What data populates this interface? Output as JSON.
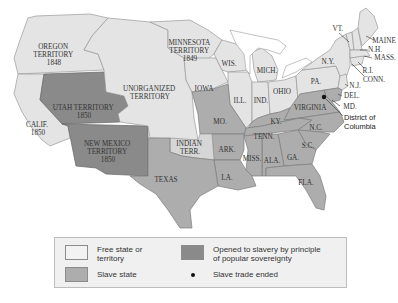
{
  "map": {
    "territories": {
      "oregon": {
        "name": "OREGON",
        "kind": "TERRITORY",
        "year": "1848",
        "status": "free"
      },
      "minnesota": {
        "name": "MINNESOTA",
        "kind": "TERRITORY",
        "year": "1849",
        "status": "free"
      },
      "unorganized": {
        "name": "UNORGANIZED",
        "kind": "TERRITORY",
        "status": "free"
      },
      "utah": {
        "name": "UTAH TERRITORY",
        "year": "1850",
        "status": "popular-sovereignty"
      },
      "new_mexico": {
        "name": "NEW MEXICO",
        "kind": "TERRITORY",
        "year": "1850",
        "status": "popular-sovereignty"
      },
      "indian": {
        "name": "INDIAN",
        "kind": "TERR.",
        "status": "indian-territory"
      }
    },
    "states": {
      "calif": {
        "name": "CALIF.",
        "year": "1850",
        "status": "free"
      },
      "iowa": {
        "name": "IOWA",
        "status": "free"
      },
      "wis": {
        "name": "WIS.",
        "status": "free"
      },
      "mich": {
        "name": "MICH.",
        "status": "free"
      },
      "ill": {
        "name": "ILL.",
        "status": "free"
      },
      "ind": {
        "name": "IND.",
        "status": "free"
      },
      "ohio": {
        "name": "OHIO",
        "status": "free"
      },
      "pa": {
        "name": "PA.",
        "status": "free"
      },
      "ny": {
        "name": "N.Y.",
        "status": "free"
      },
      "vt": {
        "name": "VT.",
        "status": "free"
      },
      "maine": {
        "name": "MAINE",
        "status": "free"
      },
      "nh": {
        "name": "N.H.",
        "status": "free"
      },
      "mass": {
        "name": "MASS.",
        "status": "free"
      },
      "ri": {
        "name": "R.I.",
        "status": "free"
      },
      "conn": {
        "name": "CONN.",
        "status": "free"
      },
      "nj": {
        "name": "N.J.",
        "status": "free"
      },
      "del": {
        "name": "DEL.",
        "status": "slave"
      },
      "md": {
        "name": "MD.",
        "status": "slave"
      },
      "mo": {
        "name": "MO.",
        "status": "slave"
      },
      "ky": {
        "name": "KY.",
        "status": "slave"
      },
      "virginia": {
        "name": "VIRGINIA",
        "status": "slave"
      },
      "tenn": {
        "name": "TENN.",
        "status": "slave"
      },
      "nc": {
        "name": "N.C.",
        "status": "slave"
      },
      "sc": {
        "name": "S.C.",
        "status": "slave"
      },
      "ark": {
        "name": "ARK.",
        "status": "slave"
      },
      "miss": {
        "name": "MISS.",
        "status": "slave"
      },
      "ala": {
        "name": "ALA.",
        "status": "slave"
      },
      "ga": {
        "name": "GA.",
        "status": "slave"
      },
      "la": {
        "name": "LA.",
        "status": "slave"
      },
      "fla": {
        "name": "FLA.",
        "status": "slave"
      },
      "texas": {
        "name": "TEXAS",
        "status": "slave"
      }
    },
    "dc": {
      "line1": "District of",
      "line2": "Columbia",
      "marker": "slave-trade-ended"
    }
  },
  "legend": {
    "items": [
      {
        "label_line1": "Free state or",
        "label_line2": "territory",
        "color": "#e4e4e4"
      },
      {
        "label_line1": "Opened to slavery by principle",
        "label_line2": "of popular sovereignty",
        "color": "#8a8a8a"
      },
      {
        "label": "Slave state",
        "color": "#adadad"
      },
      {
        "label": "Slave trade ended",
        "symbol": "dot"
      }
    ]
  }
}
